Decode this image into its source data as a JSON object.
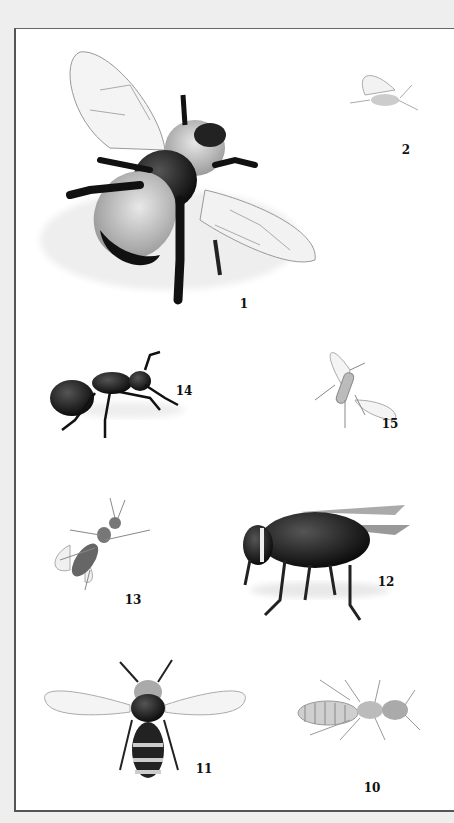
{
  "plate": {
    "background": "#ffffff",
    "outer_background": "#eeeeee",
    "specimens": [
      {
        "number": "1",
        "subject": "bumblebee",
        "label_x": 244,
        "label_y": 304
      },
      {
        "number": "2",
        "subject": "winged aphid",
        "label_x": 406,
        "label_y": 150
      },
      {
        "number": "14",
        "subject": "ant",
        "label_x": 184,
        "label_y": 391
      },
      {
        "number": "15",
        "subject": "small fly",
        "label_x": 390,
        "label_y": 424
      },
      {
        "number": "13",
        "subject": "winged ant",
        "label_x": 133,
        "label_y": 600
      },
      {
        "number": "12",
        "subject": "bald-faced hornet",
        "label_x": 386,
        "label_y": 582
      },
      {
        "number": "11",
        "subject": "honeybee",
        "label_x": 204,
        "label_y": 769
      },
      {
        "number": "10",
        "subject": "termite",
        "label_x": 372,
        "label_y": 788
      }
    ]
  }
}
